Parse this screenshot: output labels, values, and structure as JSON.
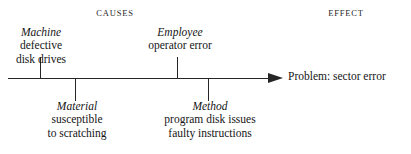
{
  "headers": {
    "causes": "CAUSES",
    "effect": "EFFECT"
  },
  "effect": {
    "label": "Problem: sector error"
  },
  "causes": [
    {
      "id": "machine",
      "title": "Machine",
      "lines": [
        "defective",
        "disk drives"
      ],
      "direction": "up"
    },
    {
      "id": "employee",
      "title": "Employee",
      "lines": [
        "operator error"
      ],
      "direction": "up"
    },
    {
      "id": "material",
      "title": "Material",
      "lines": [
        "susceptible",
        "to scratching"
      ],
      "direction": "down"
    },
    {
      "id": "method",
      "title": "Method",
      "lines": [
        "program disk issues",
        "faulty instructions"
      ],
      "direction": "down"
    }
  ],
  "colors": {
    "line": "#262626",
    "text": "#151515",
    "background": "#ffffff"
  }
}
